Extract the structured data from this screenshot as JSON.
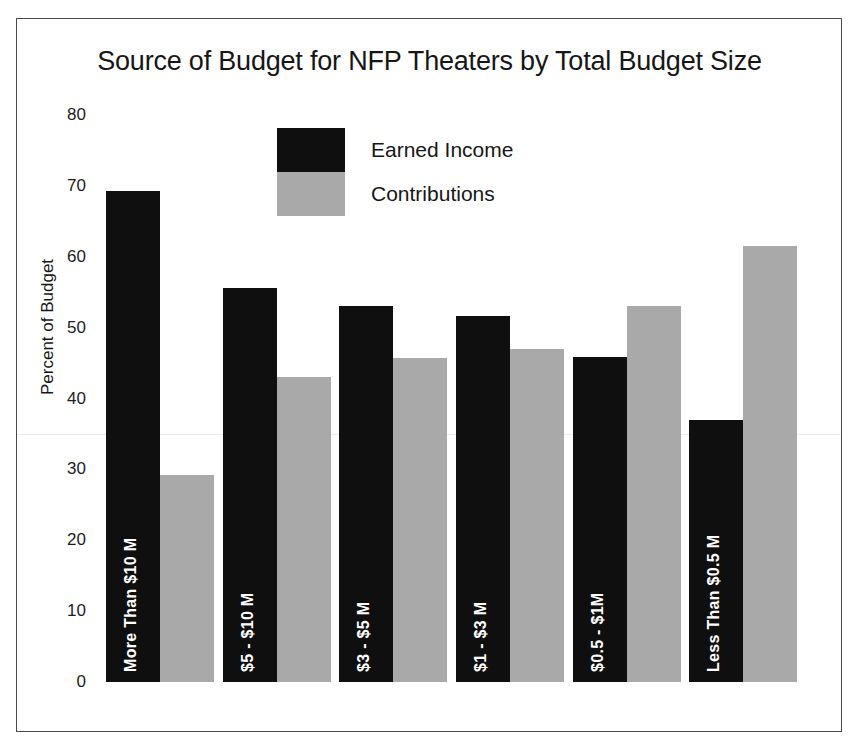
{
  "chart_data": {
    "type": "bar",
    "title": "Source of Budget for NFP Theaters by Total Budget Size",
    "xlabel": "",
    "ylabel": "Percent of Budget",
    "ylim": [
      0,
      80
    ],
    "ytick_step": 10,
    "yticks": [
      "80",
      "70",
      "60",
      "50",
      "40",
      "30",
      "20",
      "10",
      "0"
    ],
    "grid": false,
    "legend_position": "upper-center",
    "categories": [
      "More Than $10 M",
      "$5 - $10 M",
      "$3 - $5 M",
      "$1 - $3 M",
      "$0.5 - $1M",
      "Less Than $0.5 M"
    ],
    "series": [
      {
        "name": "Earned Income",
        "color": "#0f0f0f",
        "values": [
          69.3,
          55.6,
          53.0,
          51.7,
          45.8,
          36.9
        ]
      },
      {
        "name": "Contributions",
        "color": "#a9a9a9",
        "values": [
          29.2,
          43.0,
          45.7,
          47.0,
          53.0,
          61.5
        ]
      }
    ]
  },
  "legend": {
    "items": [
      {
        "label": "Earned Income",
        "swatch": "earned"
      },
      {
        "label": "Contributions",
        "swatch": "contrib"
      }
    ]
  }
}
